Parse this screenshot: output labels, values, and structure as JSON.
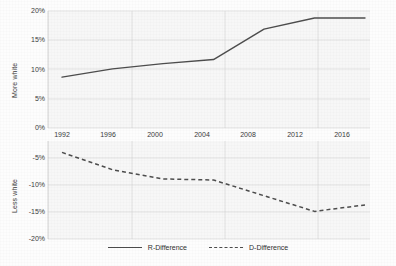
{
  "chart_data": {
    "type": "line",
    "title": "",
    "xlabel": "",
    "grid": true,
    "legend_position": "bottom-center",
    "x": [
      1992,
      1996,
      2000,
      2004,
      2008,
      2012,
      2016
    ],
    "panels": [
      {
        "name": "top",
        "ylabel": "More white",
        "ylim": [
          0,
          20
        ],
        "yticks": [
          0,
          5,
          10,
          15,
          20
        ],
        "ytick_labels": [
          "0%",
          "5%",
          "10%",
          "15%",
          "20%"
        ],
        "series": [
          {
            "name": "R-Difference",
            "style": "solid",
            "color": "#4d4d4d",
            "values": [
              8.7,
              10.1,
              11.0,
              11.7,
              16.9,
              18.8,
              18.8
            ]
          }
        ]
      },
      {
        "name": "bottom",
        "ylabel": "Less white",
        "ylim": [
          -20,
          -3
        ],
        "yticks": [
          -20,
          -15,
          -10,
          -5
        ],
        "ytick_labels": [
          "-20%",
          "-15%",
          "-10%",
          "-5%"
        ],
        "series": [
          {
            "name": "D-Difference",
            "style": "dashed",
            "color": "#4d4d4d",
            "values": [
              -4.0,
              -7.2,
              -8.9,
              -9.1,
              -12.0,
              -14.9,
              -13.7
            ]
          }
        ]
      }
    ],
    "xtick_labels": [
      "1992",
      "1996",
      "2000",
      "2004",
      "2008",
      "2012",
      "2016"
    ],
    "legend": [
      {
        "label": "R-Difference",
        "style": "solid"
      },
      {
        "label": "D-Difference",
        "style": "dashed"
      }
    ],
    "colors": {
      "line": "#4d4d4d",
      "grid": "#d8d8d8",
      "plot_background": "#f7f7f7",
      "text": "#3a3a3a"
    }
  }
}
